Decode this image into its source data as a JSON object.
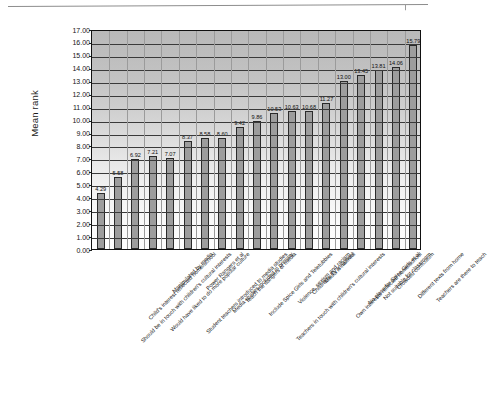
{
  "chart_data": {
    "type": "bar",
    "title": "",
    "xlabel": "",
    "ylabel": "Mean rank",
    "ylim": [
      0.0,
      17.0
    ],
    "ytick_step": 1.0,
    "grid": true,
    "legend": "none",
    "ytick_labels": [
      "17.00",
      "16.00",
      "15.00",
      "14.00",
      "13.00",
      "12.00",
      "11.00",
      "10.00",
      "9.00",
      "8.00",
      "7.00",
      "6.00",
      "5.00",
      "4.00",
      "3.00",
      "2.00",
      "1.00",
      "0.00"
    ],
    "categories": [
      "Should be in touch with children's cultural interests",
      "Child's interest reflected home/school",
      "Would have liked to do more popular culture",
      "Manipulated by media",
      "Student teachers introduced to media studies",
      "Power Rangers et al",
      "Media studies included in primary",
      "Teach the dangers of media",
      "Include Spice Girls and Teletubbies",
      "Teachers in touch with children's cultural interests",
      "Violence, sexism and racism",
      "Children's TV in school",
      "Media is harmful",
      "Own interests reflected home/school",
      "No place for Spice Girls et al",
      "Not suitable for classroom",
      "Crowded curriculum",
      "Different texts from home",
      "Teachers are there to teach"
    ],
    "values": [
      4.29,
      5.58,
      6.92,
      7.21,
      7.07,
      8.37,
      8.58,
      8.6,
      9.42,
      9.86,
      10.53,
      10.63,
      10.68,
      11.27,
      13.0,
      13.45,
      13.81,
      14.06,
      15.79
    ],
    "value_labels": [
      "4.29",
      "5.58",
      "6.92",
      "7.21",
      "7.07",
      "8.37",
      "8.58",
      "8.60",
      "9.42",
      "9.86",
      "10.53",
      "10.63",
      "10.68",
      "11.27",
      "13.00",
      "13.45",
      "13.81",
      "14.06",
      "15.79"
    ],
    "series_color": "#9d9d9d",
    "series_edge_color": "#2a2a2a"
  }
}
